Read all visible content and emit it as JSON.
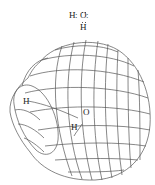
{
  "lewis_structure": {
    "atoms": [
      "H",
      "O",
      "H"
    ],
    "left_h": "H",
    "oxygen": "O",
    "bottom_h": "H",
    "bond_colon": ":",
    "formula_text": "H:Ö:H"
  },
  "cloud_model": {
    "labels": {
      "hydrogen_left": "H",
      "oxygen": "O",
      "hydrogen_bottom": "H"
    },
    "line_color": "#555555",
    "background": "#ffffff"
  }
}
